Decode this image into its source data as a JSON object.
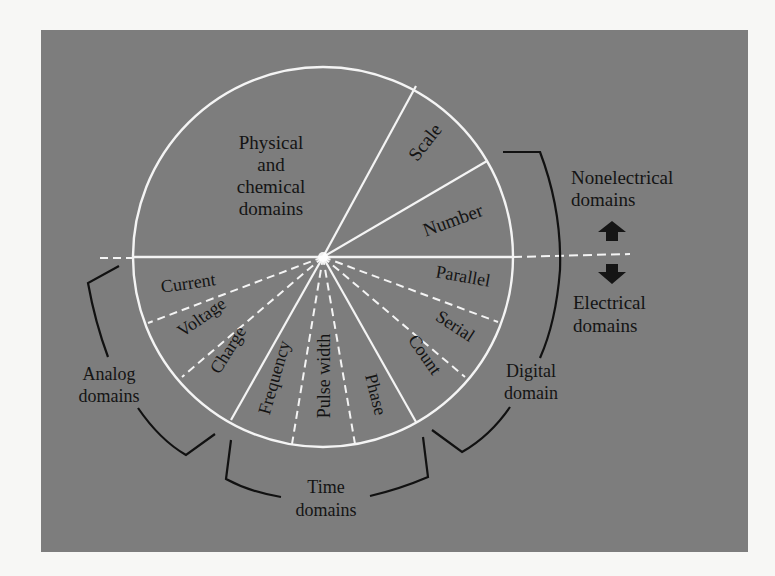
{
  "colors": {
    "page_background": "#f7f7f5",
    "panel_background": "#7d7d7d",
    "circle_lines": "#f4f4f4",
    "text": "#141414",
    "brackets": "#111111",
    "arrows": "#151515"
  },
  "circle": {
    "upper_region_label": [
      "Physical",
      "and",
      "chemical",
      "domains"
    ],
    "upper_sectors": [
      {
        "label": "Scale"
      },
      {
        "label": "Number"
      }
    ],
    "digital_sectors": [
      {
        "label": "Parallel"
      },
      {
        "label": "Serial"
      },
      {
        "label": "Count"
      }
    ],
    "time_sectors": [
      {
        "label": "Phase"
      },
      {
        "label": "Pulse width"
      },
      {
        "label": "Frequency"
      }
    ],
    "analog_sectors": [
      {
        "label": "Charge"
      },
      {
        "label": "Voltage"
      },
      {
        "label": "Current"
      }
    ]
  },
  "groups": {
    "analog": [
      "Analog",
      "domains"
    ],
    "time": [
      "Time",
      "domains"
    ],
    "digital": [
      "Digital",
      "domain"
    ]
  },
  "legend": {
    "top": [
      "Nonelectrical",
      "domains"
    ],
    "bottom": [
      "Electrical",
      "domains"
    ],
    "up_arrow_icon": "arrow-up-icon",
    "down_arrow_icon": "arrow-down-icon"
  }
}
